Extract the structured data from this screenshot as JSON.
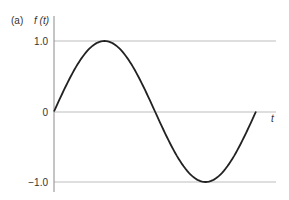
{
  "panel_label": "(a)",
  "chart_data": {
    "type": "line",
    "title": "",
    "panel": "(a)",
    "xlabel": "t",
    "ylabel": "f (t)",
    "yticks": [
      1.0,
      0,
      -1.0
    ],
    "ytick_labels": [
      "1.0",
      "0",
      "−1.0"
    ],
    "ylim": [
      -1.0,
      1.0
    ],
    "grid": "horizontal lines at y=1.0, 0, -1.0",
    "series": [
      {
        "name": "f(t) = sin(t)",
        "description": "one full period of a sine wave starting at 0, peaking at 1.0, crossing 0, troughing at -1.0, returning to 0",
        "x": [
          0,
          0.125,
          0.25,
          0.375,
          0.5,
          0.625,
          0.75,
          0.875,
          1.0
        ],
        "values": [
          0,
          0.707,
          1.0,
          0.707,
          0,
          -0.707,
          -1.0,
          -0.707,
          0
        ]
      }
    ],
    "colors": {
      "curve": "#222222",
      "grid": "#bbbbbb",
      "axis": "#888888",
      "text": "#333333"
    }
  }
}
